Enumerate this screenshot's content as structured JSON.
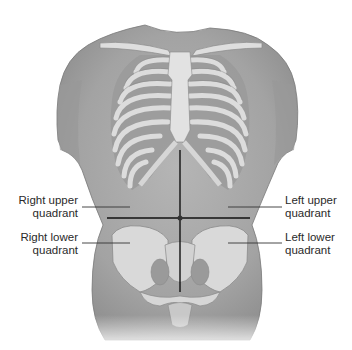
{
  "figure": {
    "colors": {
      "background": "#ffffff",
      "skin": "#a9a9a9",
      "skin_dark": "#8e8e8e",
      "bone": "#dcdcdc",
      "bone_outline": "#8a8a8a",
      "rib_gap": "#9c9c9c",
      "lines": "#111111",
      "text": "#2a2a2a"
    }
  },
  "labels": {
    "right_upper": {
      "line1": "Right upper",
      "line2": "quadrant"
    },
    "right_lower": {
      "line1": "Right lower",
      "line2": "quadrant"
    },
    "left_upper": {
      "line1": "Left upper",
      "line2": "quadrant"
    },
    "left_lower": {
      "line1": "Left lower",
      "line2": "quadrant"
    }
  }
}
